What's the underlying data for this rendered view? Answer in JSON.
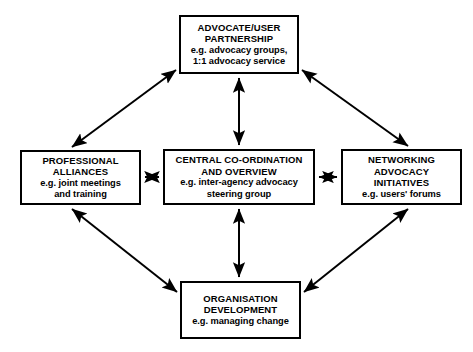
{
  "diagram": {
    "line_color": "#000000",
    "box_fill": "#ffffff",
    "nodes": {
      "top": {
        "title": "ADVOCATE/USER\nPARTNERSHIP",
        "example": "e.g. advocacy groups,\n1:1 advocacy service"
      },
      "left": {
        "title": "PROFESSIONAL\nALLIANCES",
        "example": "e.g. joint meetings\nand training"
      },
      "center": {
        "title": "CENTRAL CO-ORDINATION\nAND OVERVIEW",
        "example": "e.g. inter-agency advocacy\nsteering group"
      },
      "right": {
        "title": "NETWORKING\nADVOCACY\nINITIATIVES",
        "example": "e.g. users' forums"
      },
      "bottom": {
        "title": "ORGANISATION\nDEVELOPMENT",
        "example": "e.g. managing change"
      }
    },
    "connectors": [
      {
        "name": "left-to-top",
        "from": "left",
        "to": "top",
        "style": "double-headed"
      },
      {
        "name": "top-to-right",
        "from": "top",
        "to": "right",
        "style": "double-headed"
      },
      {
        "name": "left-to-bottom",
        "from": "left",
        "to": "bottom",
        "style": "double-headed"
      },
      {
        "name": "bottom-to-right",
        "from": "bottom",
        "to": "right",
        "style": "double-headed"
      },
      {
        "name": "center-to-top",
        "from": "center",
        "to": "top",
        "style": "double-headed"
      },
      {
        "name": "center-to-bottom",
        "from": "center",
        "to": "bottom",
        "style": "double-headed"
      },
      {
        "name": "center-to-left",
        "from": "center",
        "to": "left",
        "style": "double-headed"
      },
      {
        "name": "center-to-right",
        "from": "center",
        "to": "right",
        "style": "double-headed"
      }
    ]
  }
}
